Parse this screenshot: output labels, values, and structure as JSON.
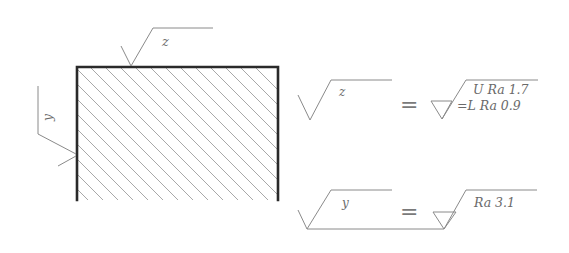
{
  "drawing": {
    "part": {
      "description": "hatched rectangular cross-section",
      "hatch_direction": "top-left to bottom-right"
    },
    "callouts": {
      "top_surface_label": "z",
      "left_surface_label": "y"
    },
    "legend": {
      "rows": [
        {
          "symbol_label": "z",
          "equals": "=",
          "upper_line": "U Ra 1.7",
          "lower_line": "=L Ra 0.9"
        },
        {
          "symbol_label": "y",
          "equals": "=",
          "value": "Ra 3.1"
        }
      ]
    },
    "colors": {
      "outline": "#2a2a2a",
      "thin_line": "#8a8a8a",
      "hatch": "#a8a8a8",
      "background": "#ffffff"
    }
  }
}
